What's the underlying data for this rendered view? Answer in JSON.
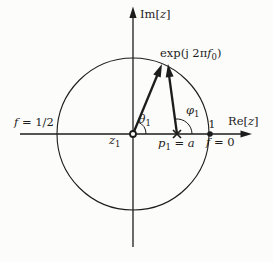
{
  "figure": {
    "colors": {
      "ink": "#1c1c1c",
      "paper": "#fcfcfb"
    },
    "axes": {
      "imaginary": {
        "open": "Im[",
        "var": "z",
        "close": "]"
      },
      "real": {
        "open": "Re[",
        "var": "z",
        "close": "]"
      }
    },
    "exp_label": {
      "prefix": "exp(j 2π",
      "var": "f",
      "sub": "0",
      "suffix": ")"
    },
    "angles": {
      "theta": {
        "sym": "θ",
        "sub": "1"
      },
      "phi": {
        "sym": "φ",
        "sub": "1"
      }
    },
    "freq": {
      "half": {
        "var": "f",
        "eq": " = 1/2"
      },
      "zero": {
        "var": "f",
        "eq": " = 0"
      }
    },
    "points": {
      "unit": "1",
      "zero": {
        "var": "z",
        "sub": "1"
      },
      "pole": {
        "var": "p",
        "sub": "1",
        "eq": " = ",
        "val": "a"
      }
    }
  }
}
